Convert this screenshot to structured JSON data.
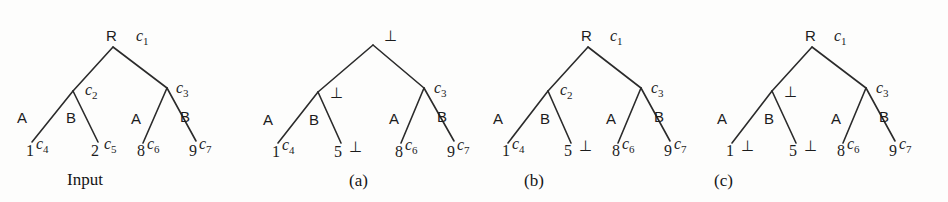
{
  "figure": {
    "background_color": "#fdfdfc",
    "ink_color": "#1c1c1c",
    "bottom_symbol": "⊥",
    "trees": [
      {
        "id": "input",
        "caption": "Input",
        "root_label": "R",
        "root_cost": "c",
        "root_cost_sub": "1",
        "left_internal_label": "",
        "left_internal_cost": "c",
        "left_internal_cost_sub": "2",
        "right_internal_label": "",
        "right_internal_cost": "c",
        "right_internal_cost_sub": "3",
        "leaves": [
          {
            "edge_label": "A",
            "number": "1",
            "cost": "c",
            "cost_sub": "4"
          },
          {
            "edge_label": "B",
            "number": "2",
            "cost": "c",
            "cost_sub": "5"
          },
          {
            "edge_label": "A",
            "number": "8",
            "cost": "c",
            "cost_sub": "6"
          },
          {
            "edge_label": "B",
            "number": "9",
            "cost": "c",
            "cost_sub": "7"
          }
        ]
      },
      {
        "id": "a",
        "caption": "(a)",
        "root_label": "",
        "root_cost": "⊥",
        "root_cost_sub": "",
        "left_internal_label": "",
        "left_internal_cost": "⊥",
        "left_internal_cost_sub": "",
        "right_internal_label": "",
        "right_internal_cost": "c",
        "right_internal_cost_sub": "3",
        "leaves": [
          {
            "edge_label": "A",
            "number": "1",
            "cost": "c",
            "cost_sub": "4"
          },
          {
            "edge_label": "B",
            "number": "5",
            "cost": "⊥",
            "cost_sub": ""
          },
          {
            "edge_label": "A",
            "number": "8",
            "cost": "c",
            "cost_sub": "6"
          },
          {
            "edge_label": "B",
            "number": "9",
            "cost": "c",
            "cost_sub": "7"
          }
        ]
      },
      {
        "id": "b",
        "caption": "(b)",
        "root_label": "R",
        "root_cost": "c",
        "root_cost_sub": "1",
        "left_internal_label": "",
        "left_internal_cost": "c",
        "left_internal_cost_sub": "2",
        "right_internal_label": "",
        "right_internal_cost": "c",
        "right_internal_cost_sub": "3",
        "leaves": [
          {
            "edge_label": "A",
            "number": "1",
            "cost": "c",
            "cost_sub": "4"
          },
          {
            "edge_label": "B",
            "number": "5",
            "cost": "⊥",
            "cost_sub": ""
          },
          {
            "edge_label": "A",
            "number": "8",
            "cost": "c",
            "cost_sub": "6"
          },
          {
            "edge_label": "B",
            "number": "9",
            "cost": "c",
            "cost_sub": "7"
          }
        ]
      },
      {
        "id": "c",
        "caption": "(c)",
        "root_label": "R",
        "root_cost": "c",
        "root_cost_sub": "1",
        "left_internal_label": "",
        "left_internal_cost": "⊥",
        "left_internal_cost_sub": "",
        "right_internal_label": "",
        "right_internal_cost": "c",
        "right_internal_cost_sub": "3",
        "leaves": [
          {
            "edge_label": "A",
            "number": "1",
            "cost": "⊥",
            "cost_sub": ""
          },
          {
            "edge_label": "B",
            "number": "5",
            "cost": "⊥",
            "cost_sub": ""
          },
          {
            "edge_label": "A",
            "number": "8",
            "cost": "c",
            "cost_sub": "6"
          },
          {
            "edge_label": "B",
            "number": "9",
            "cost": "c",
            "cost_sub": "7"
          }
        ]
      }
    ]
  }
}
